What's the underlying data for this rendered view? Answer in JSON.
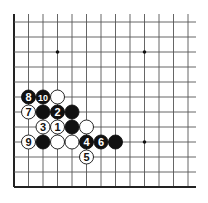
{
  "diagram": {
    "board": {
      "columns": 13,
      "rows": 12,
      "origin_x": 14,
      "origin_y": 22,
      "spacing_x": 14.5,
      "spacing_y": 15,
      "line_top_y": 14,
      "line_right_x": 196,
      "edges": [
        "left",
        "bottom"
      ],
      "line_color": "#555555",
      "edge_color": "#222222"
    },
    "star_points": [
      {
        "col": 3,
        "row": 2
      },
      {
        "col": 9,
        "row": 2
      },
      {
        "col": 9,
        "row": 8
      }
    ],
    "stones": [
      {
        "col": 1,
        "row": 5,
        "color": "black",
        "label": "8"
      },
      {
        "col": 2,
        "row": 5,
        "color": "black",
        "label": "10"
      },
      {
        "col": 3,
        "row": 5,
        "color": "white",
        "label": ""
      },
      {
        "col": 1,
        "row": 6,
        "color": "white",
        "label": "7"
      },
      {
        "col": 2,
        "row": 6,
        "color": "black",
        "label": ""
      },
      {
        "col": 3,
        "row": 6,
        "color": "black",
        "label": "2"
      },
      {
        "col": 4,
        "row": 6,
        "color": "black",
        "label": ""
      },
      {
        "col": 2,
        "row": 7,
        "color": "white",
        "label": "3"
      },
      {
        "col": 3,
        "row": 7,
        "color": "white",
        "label": "1"
      },
      {
        "col": 4,
        "row": 7,
        "color": "black",
        "label": ""
      },
      {
        "col": 5,
        "row": 7,
        "color": "white",
        "label": ""
      },
      {
        "col": 1,
        "row": 8,
        "color": "white",
        "label": "9"
      },
      {
        "col": 2,
        "row": 8,
        "color": "black",
        "label": ""
      },
      {
        "col": 3,
        "row": 8,
        "color": "white",
        "label": ""
      },
      {
        "col": 4,
        "row": 8,
        "color": "white",
        "label": ""
      },
      {
        "col": 5,
        "row": 8,
        "color": "black",
        "label": "4"
      },
      {
        "col": 6,
        "row": 8,
        "color": "black",
        "label": "6"
      },
      {
        "col": 7,
        "row": 8,
        "color": "black",
        "label": ""
      },
      {
        "col": 5,
        "row": 9,
        "color": "white",
        "label": "5"
      }
    ],
    "colors": {
      "black_stone": "#111111",
      "white_stone": "#ffffff",
      "stone_outline": "#111111",
      "star_point": "#111111"
    }
  }
}
